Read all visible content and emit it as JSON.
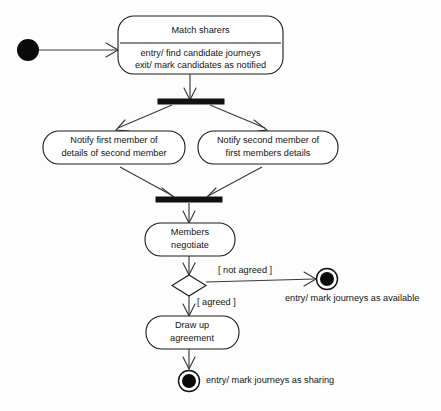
{
  "diagram": {
    "type": "uml-activity-diagram",
    "title": "",
    "colors": {
      "background": "#fdfdfd",
      "stroke": "#1a1a1a",
      "edge": "#3a3a3a",
      "fill": "#ffffff",
      "solid": "#0a0a0a"
    },
    "nodes": {
      "initial": {
        "name": "initial-node",
        "label": ""
      },
      "match_sharers": {
        "title": "Match sharers",
        "entry_action": "entry/ find candidate journeys",
        "exit_action": "exit/ mark candidates as notified"
      },
      "fork_bar": {
        "label": ""
      },
      "notify_first": {
        "line1": "Notify first member of",
        "line2": "details of second member"
      },
      "notify_second": {
        "line1": "Notify second member of",
        "line2": "first members details"
      },
      "join_bar": {
        "label": ""
      },
      "members_negotiate": {
        "line1": "Members",
        "line2": "negotiate"
      },
      "decision": {
        "label": ""
      },
      "draw_up_agreement": {
        "line1": "Draw up",
        "line2": "agreement"
      },
      "final_not_agreed": {
        "annotation": "entry/ mark journeys as available"
      },
      "final_agreed": {
        "annotation": "entry/ mark journeys as sharing"
      }
    },
    "edges": {
      "guard_not_agreed": "[ not agreed ]",
      "guard_agreed": "[ agreed ]"
    }
  }
}
